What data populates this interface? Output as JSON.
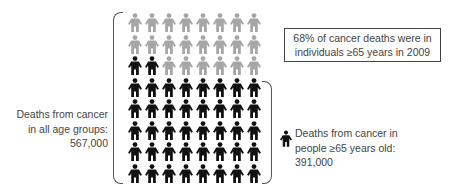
{
  "chart_data": {
    "type": "pictograph",
    "title": "",
    "grid": {
      "columns": 8,
      "rows": 8,
      "total_icons": 64
    },
    "rows": [
      [
        "gray",
        "gray",
        "gray",
        "gray",
        "gray",
        "gray",
        "gray",
        "gray"
      ],
      [
        "gray",
        "gray",
        "gray",
        "gray",
        "gray",
        "gray",
        "gray",
        "gray"
      ],
      [
        "black",
        "black",
        "gray",
        "gray",
        "gray",
        "gray",
        "gray",
        "gray"
      ],
      [
        "black",
        "black",
        "black",
        "black",
        "black",
        "black",
        "black",
        "black"
      ],
      [
        "black",
        "black",
        "black",
        "black",
        "black",
        "black",
        "black",
        "black"
      ],
      [
        "black",
        "black",
        "black",
        "black",
        "black",
        "black",
        "black",
        "black"
      ],
      [
        "black",
        "black",
        "black",
        "black",
        "black",
        "black",
        "black",
        "black"
      ],
      [
        "black",
        "black",
        "black",
        "black",
        "black",
        "black",
        "black",
        "black"
      ]
    ],
    "series": [
      {
        "name": "Deaths from cancer in people ≥65 years old",
        "value": 391000,
        "icons": 42,
        "color": "#111111"
      },
      {
        "name": "Deaths from cancer in people <65 years old",
        "value": 176000,
        "icons": 22,
        "color": "#a6a6a6"
      }
    ],
    "total": 567000,
    "percent_65_plus": 68,
    "year": 2009
  },
  "colors": {
    "black_icon": "#111111",
    "gray_icon": "#a6a6a6",
    "text": "#444444",
    "bracket": "#555555"
  },
  "callout": {
    "line1": "68% of cancer deaths were in",
    "line2": "individuals ≥65 years in 2009"
  },
  "left_label": {
    "line1": "Deaths from cancer",
    "line2": "in all age groups:",
    "line3": "567,000"
  },
  "right_legend": {
    "icon": "person-icon-black",
    "line1": "Deaths from cancer in",
    "line2": "people ≥65 years old:",
    "line3": "391,000"
  }
}
